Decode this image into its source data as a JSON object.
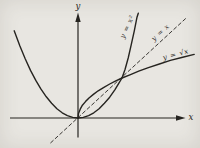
{
  "colors": {
    "background": "#e8e6e1",
    "ink": "#262420"
  },
  "axes": {
    "x_label": "x",
    "y_label": "y"
  },
  "chart_data": {
    "type": "line",
    "xlabel": "x",
    "ylabel": "y",
    "xlim": [
      -1.55,
      2.45
    ],
    "ylim": [
      -0.55,
      2.65
    ],
    "grid": false,
    "legend": "inline-rotated-labels",
    "series": [
      {
        "name": "y = x²",
        "key": "parabola",
        "style": "solid",
        "points": [
          [
            -1.45,
            2.18
          ],
          [
            -1.32,
            1.8
          ],
          [
            -1.2,
            1.48
          ],
          [
            -1.08,
            1.19
          ],
          [
            -0.96,
            0.94
          ],
          [
            -0.84,
            0.72
          ],
          [
            -0.72,
            0.53
          ],
          [
            -0.6,
            0.37
          ],
          [
            -0.48,
            0.23
          ],
          [
            -0.36,
            0.13
          ],
          [
            -0.24,
            0.06
          ],
          [
            -0.12,
            0.015
          ],
          [
            0,
            0
          ],
          [
            0.12,
            0.015
          ],
          [
            0.24,
            0.06
          ],
          [
            0.36,
            0.13
          ],
          [
            0.48,
            0.23
          ],
          [
            0.6,
            0.37
          ],
          [
            0.72,
            0.52
          ],
          [
            0.84,
            0.71
          ],
          [
            0.93,
            0.87
          ],
          [
            1.0,
            1.0
          ],
          [
            1.07,
            1.22
          ],
          [
            1.14,
            1.5
          ],
          [
            1.21,
            1.83
          ],
          [
            1.28,
            2.18
          ],
          [
            1.34,
            2.52
          ],
          [
            1.37,
            2.62
          ]
        ]
      },
      {
        "name": "y = x",
        "key": "identity",
        "style": "dashed",
        "points": [
          [
            -0.62,
            -0.62
          ],
          [
            2.48,
            2.52
          ]
        ]
      },
      {
        "name": "y = √x",
        "key": "sqrt",
        "style": "solid",
        "points": [
          [
            0,
            0
          ],
          [
            0.012,
            0.11
          ],
          [
            0.05,
            0.22
          ],
          [
            0.1,
            0.32
          ],
          [
            0.17,
            0.41
          ],
          [
            0.25,
            0.5
          ],
          [
            0.35,
            0.59
          ],
          [
            0.46,
            0.68
          ],
          [
            0.58,
            0.76
          ],
          [
            0.72,
            0.85
          ],
          [
            0.86,
            0.93
          ],
          [
            1.0,
            1.0
          ],
          [
            1.18,
            1.08
          ],
          [
            1.38,
            1.17
          ],
          [
            1.6,
            1.26
          ],
          [
            1.85,
            1.35
          ],
          [
            2.1,
            1.44
          ],
          [
            2.38,
            1.52
          ],
          [
            2.64,
            1.59
          ]
        ]
      }
    ]
  }
}
